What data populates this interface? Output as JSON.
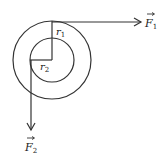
{
  "diagram": {
    "type": "concentric-circles-with-forces",
    "colors": {
      "stroke": "#333333",
      "background": "#ffffff"
    },
    "outer_circle": {
      "cx": 52,
      "cy": 60,
      "r": 39
    },
    "inner_circle": {
      "cx": 52,
      "cy": 60,
      "r": 22
    },
    "labels": {
      "r1": {
        "base": "r",
        "sub": "1"
      },
      "r2": {
        "base": "r",
        "sub": "2"
      },
      "F1": {
        "base": "F",
        "sub": "1",
        "vector": true
      },
      "F2": {
        "base": "F",
        "sub": "2",
        "vector": true
      }
    },
    "forces": [
      {
        "name": "F1",
        "direction": "right",
        "from": [
          52,
          22
        ],
        "to": [
          141,
          22
        ]
      },
      {
        "name": "F2",
        "direction": "down",
        "from": [
          31,
          60
        ],
        "to": [
          31,
          130
        ]
      }
    ]
  }
}
